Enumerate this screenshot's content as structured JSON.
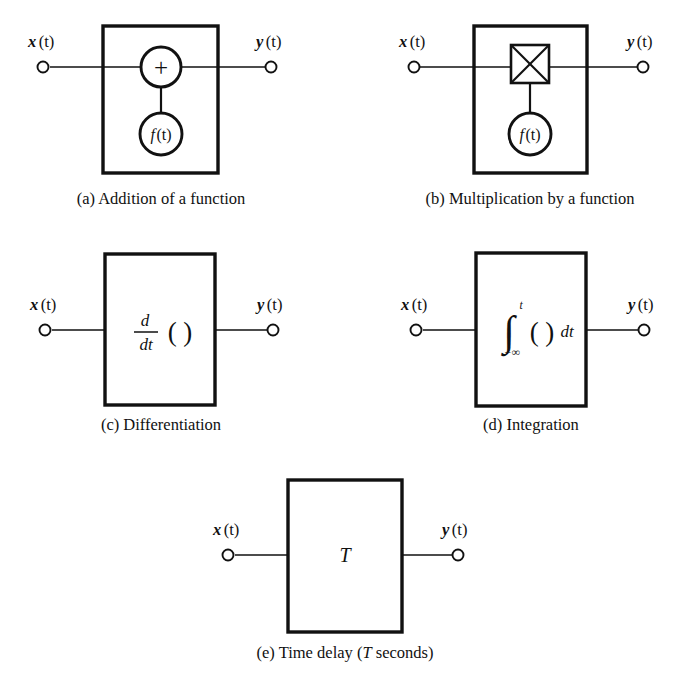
{
  "figure": {
    "background_color": "#ffffff",
    "ink_color": "#111111",
    "panels": [
      {
        "id": "a",
        "caption": "(a) Addition of a function",
        "input_label": "x (t)",
        "input_var": "x",
        "input_arg": "(t)",
        "output_label": "y (t)",
        "output_var": "y",
        "output_arg": "(t)",
        "operator_symbol": "+",
        "operator_name": "summing-junction",
        "function_label": "f (t)",
        "function_var": "f",
        "function_arg": "(t)"
      },
      {
        "id": "b",
        "caption": "(b) Multiplication by a function",
        "input_label": "x (t)",
        "input_var": "x",
        "input_arg": "(t)",
        "output_label": "y (t)",
        "output_var": "y",
        "output_arg": "(t)",
        "operator_symbol": "×",
        "operator_name": "multiplier-cross-box",
        "function_label": "f (t)",
        "function_var": "f",
        "function_arg": "(t)"
      },
      {
        "id": "c",
        "caption": "(c) Differentiation",
        "input_label": "x (t)",
        "input_var": "x",
        "input_arg": "(t)",
        "output_label": "y (t)",
        "output_var": "y",
        "output_arg": "(t)",
        "expression_numerator": "d",
        "expression_denominator": "dt",
        "expression_operand": "( )",
        "expression_plain": "d/dt ( )"
      },
      {
        "id": "d",
        "caption": "(d) Integration",
        "input_label": "x (t)",
        "input_var": "x",
        "input_arg": "(t)",
        "output_label": "y (t)",
        "output_var": "y",
        "output_arg": "(t)",
        "integral_sign": "∫",
        "integral_upper_limit": "t",
        "integral_lower_limit": "−∞",
        "integral_operand": "( )",
        "integral_differential": "dt",
        "expression_plain": "∫ from −∞ to t ( ) dt"
      },
      {
        "id": "e",
        "caption_prefix": "(e) Time delay (",
        "caption_symbol": "T",
        "caption_suffix": " seconds)",
        "caption": "(e) Time delay (T seconds)",
        "input_label": "x (t)",
        "input_var": "x",
        "input_arg": "(t)",
        "output_label": "y (t)",
        "output_var": "y",
        "output_arg": "(t)",
        "block_symbol": "T"
      }
    ]
  }
}
